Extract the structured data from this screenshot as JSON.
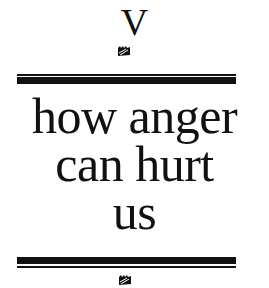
{
  "chapter": {
    "number": "V",
    "ornament_icon": "fleuron-ornament-icon"
  },
  "title": {
    "lines": [
      "how anger",
      "can hurt",
      "us"
    ]
  },
  "colors": {
    "ink": "#111111",
    "paper": "#ffffff"
  }
}
